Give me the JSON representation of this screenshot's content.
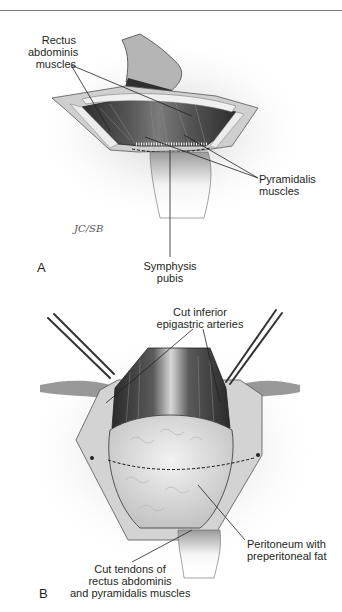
{
  "figure": {
    "panel_a": {
      "letter": "A",
      "labels": {
        "rectus": [
          "Rectus",
          "abdominis",
          "muscles"
        ],
        "pyramidalis": [
          "Pyramidalis",
          "muscles"
        ],
        "symphysis": [
          "Symphysis",
          "pubis"
        ]
      },
      "signature": "JC/SB"
    },
    "panel_b": {
      "letter": "B",
      "labels": {
        "arteries": [
          "Cut inferior",
          "epigastric arteries"
        ],
        "peritoneum": [
          "Peritoneum with",
          "preperitoneal fat"
        ],
        "tendons": [
          "Cut tendons of",
          "rectus abdominis",
          "and pyramidalis muscles"
        ]
      }
    },
    "colors": {
      "ink": "#231f20",
      "rule": "#7a7a7a",
      "muscle_dark": "#3a3a3a",
      "muscle_mid": "#6e6e6e",
      "skin": "#c8c8c8",
      "fat": "#d9d9d9"
    }
  }
}
